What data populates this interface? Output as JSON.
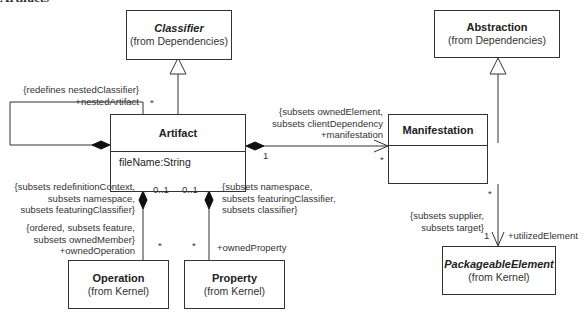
{
  "diagram": {
    "clipped_title": "Artifacts",
    "classes": {
      "classifier": {
        "name": "Classifier",
        "from": "(from Dependencies)",
        "abstract": true
      },
      "abstraction": {
        "name": "Abstraction",
        "from": "(from Dependencies)",
        "abstract": false
      },
      "artifact": {
        "name": "Artifact",
        "attributes": [
          "fileName:String"
        ]
      },
      "manifestation": {
        "name": "Manifestation",
        "attributes": []
      },
      "operation": {
        "name": "Operation",
        "from": "(from Kernel)"
      },
      "property": {
        "name": "Property",
        "from": "(from Kernel)"
      },
      "packageable_element": {
        "name": "PackageableElement",
        "from": "(from Kernel)",
        "abstract": true
      }
    },
    "associations": {
      "nested_artifact": {
        "constraint": "{redefines nestedClassifier}",
        "role": "+nestedArtifact",
        "multiplicity": "*"
      },
      "manifestation": {
        "constraint_line1": "{subsets ownedElement,",
        "constraint_line2": "subsets clientDependency",
        "role": "+manifestation",
        "source_multiplicity": "1",
        "target_multiplicity": "*"
      },
      "owned_operation": {
        "owner_constraint_line1": "{subsets redefinitionContext,",
        "owner_constraint_line2": "subsets namespace,",
        "owner_constraint_line3": "subsets featuringClassifier}",
        "owner_multiplicity": "0..1",
        "constraint_line1": "{ordered, subsets feature,",
        "constraint_line2": "subsets ownedMember}",
        "role": "+ownedOperation",
        "multiplicity": "*"
      },
      "owned_property": {
        "owner_constraint_line1": "{subsets namespace,",
        "owner_constraint_line2": "subsets featuringClassifier,",
        "owner_constraint_line3": "subsets classifier}",
        "owner_multiplicity": "0..1",
        "role": "+ownedProperty",
        "multiplicity": "*"
      },
      "utilized_element": {
        "source_multiplicity": "*",
        "constraint_line1": "{subsets supplier,",
        "constraint_line2": "subsets target}",
        "multiplicity": "1",
        "role": "+utilizedElement"
      }
    }
  }
}
